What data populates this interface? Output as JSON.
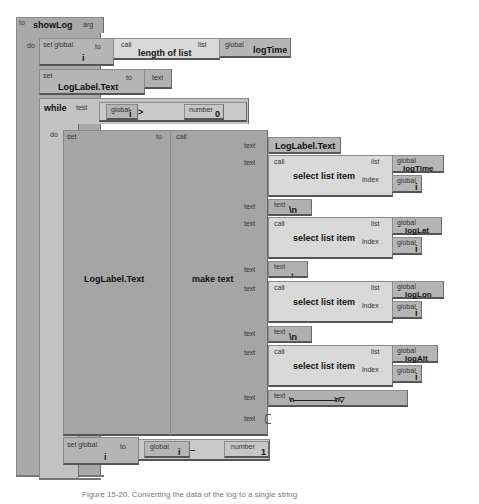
{
  "procedure": {
    "to_label": "to",
    "name": "showLog",
    "arg_label": "arg",
    "do_label": "do"
  },
  "set_i": {
    "set_label": "set global",
    "var": "i",
    "to_label": "to",
    "call_label": "call",
    "func": "length of list",
    "list_label": "list",
    "global_label": "global",
    "list_var": "logTime"
  },
  "set_label_text": {
    "set_label": "set",
    "target": "LogLabel.Text",
    "to_label": "to",
    "text_label": "text"
  },
  "while_block": {
    "while_label": "while",
    "test_label": "test",
    "global_label": "global",
    "var": "i",
    "op": ">",
    "number_label": "number",
    "number_value": "0",
    "do_label": "do"
  },
  "set_make_text": {
    "set_label": "set",
    "target": "LogLabel.Text",
    "to_label": "to",
    "call_label": "call",
    "func": "make text"
  },
  "make_text_items": [
    {
      "socket": "text",
      "kind": "getter",
      "value": "LogLabel.Text"
    },
    {
      "socket": "text",
      "kind": "select",
      "call_label": "call",
      "func": "select list item",
      "list_label": "list",
      "index_label": "index",
      "global_label": "global",
      "list_var": "logTime",
      "index_var": "i"
    },
    {
      "socket": "text",
      "kind": "text",
      "text_label": "text",
      "value": "\\n"
    },
    {
      "socket": "text",
      "kind": "select",
      "call_label": "call",
      "func": "select list item",
      "list_label": "list",
      "index_label": "index",
      "global_label": "global",
      "list_var": "logLat",
      "index_var": "i"
    },
    {
      "socket": "text",
      "kind": "text",
      "text_label": "text",
      "value": ","
    },
    {
      "socket": "text",
      "kind": "select",
      "call_label": "call",
      "func": "select list item",
      "list_label": "list",
      "index_label": "index",
      "global_label": "global",
      "list_var": "logLon",
      "index_var": "i"
    },
    {
      "socket": "text",
      "kind": "text",
      "text_label": "text",
      "value": "\\n"
    },
    {
      "socket": "text",
      "kind": "select",
      "call_label": "call",
      "func": "select list item",
      "list_label": "list",
      "index_label": "index",
      "global_label": "global",
      "list_var": "logAlt",
      "index_var": "i"
    },
    {
      "socket": "text",
      "kind": "text",
      "text_label": "text",
      "value": "\\n-------------------------------\\n▽"
    },
    {
      "socket": "text",
      "kind": "empty"
    }
  ],
  "decrement": {
    "set_label": "set global",
    "var": "i",
    "to_label": "to",
    "global_label": "global",
    "op": "–",
    "number_label": "number",
    "number_value": "1"
  },
  "caption": "Figure 15-20. Converting the data of the log to a single string"
}
